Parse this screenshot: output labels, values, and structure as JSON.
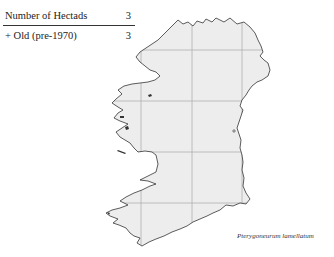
{
  "legend": {
    "title_label": "Number of Hectads",
    "title_value": "3",
    "rows": [
      {
        "symbol": "+",
        "label": "+ Old  (pre-1970)",
        "value": "3"
      }
    ]
  },
  "map": {
    "region": "Ireland",
    "fill_color": "#ededed",
    "grid_color": "#b0b0b0",
    "coast_color": "#333333",
    "grid_x": [
      141,
      192,
      242
    ],
    "grid_y": [
      50,
      101,
      152,
      203
    ]
  },
  "species_name": "Pterygoneurum lamellatum"
}
